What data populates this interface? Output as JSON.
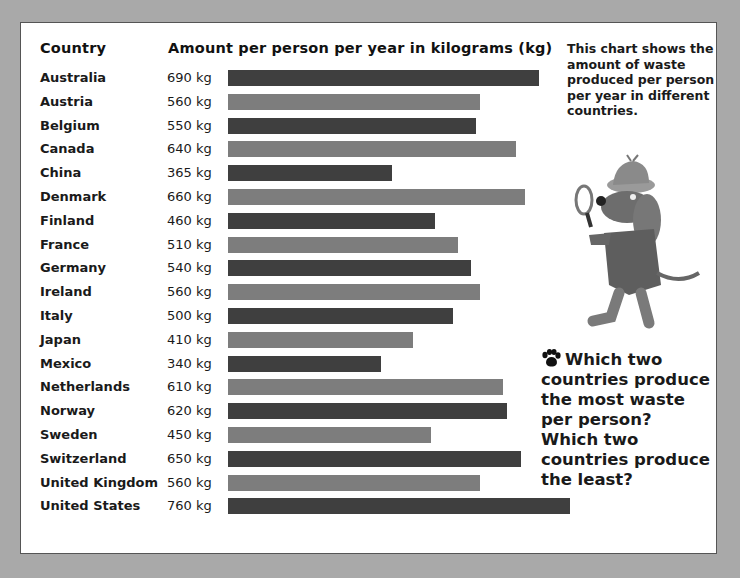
{
  "header": {
    "country_label": "Country",
    "amount_label": "Amount per person per year in kilograms (kg)"
  },
  "rows": [
    {
      "country": "Australia",
      "amount": "690 kg"
    },
    {
      "country": "Austria",
      "amount": "560 kg"
    },
    {
      "country": "Belgium",
      "amount": "550 kg"
    },
    {
      "country": "Canada",
      "amount": "640 kg"
    },
    {
      "country": "China",
      "amount": "365 kg"
    },
    {
      "country": "Denmark",
      "amount": "660 kg"
    },
    {
      "country": "Finland",
      "amount": "460 kg"
    },
    {
      "country": "France",
      "amount": "510 kg"
    },
    {
      "country": "Germany",
      "amount": "540 kg"
    },
    {
      "country": "Ireland",
      "amount": "560 kg"
    },
    {
      "country": "Italy",
      "amount": "500 kg"
    },
    {
      "country": "Japan",
      "amount": "410 kg"
    },
    {
      "country": "Mexico",
      "amount": "340 kg"
    },
    {
      "country": "Netherlands",
      "amount": "610 kg"
    },
    {
      "country": "Norway",
      "amount": "620 kg"
    },
    {
      "country": "Sweden",
      "amount": "450 kg"
    },
    {
      "country": "Switzerland",
      "amount": "650 kg"
    },
    {
      "country": "United Kingdom",
      "amount": "560 kg"
    },
    {
      "country": "United States",
      "amount": "760 kg"
    }
  ],
  "note": "This chart shows the amount of waste produced per person per year in different countries.",
  "question": {
    "icon": "paw-icon",
    "text": "Which two countries produce the most waste per person? Which two countries produce the least?"
  },
  "colors": {
    "bar_dark": "#3f3f3f",
    "bar_light": "#7d7d7d",
    "background": "#a9a9a9",
    "panel": "#ffffff"
  },
  "chart_data": {
    "type": "bar",
    "orientation": "horizontal",
    "title": "Amount per person per year in kilograms (kg)",
    "xlabel": "Amount per person per year in kilograms (kg)",
    "ylabel": "Country",
    "categories": [
      "Australia",
      "Austria",
      "Belgium",
      "Canada",
      "China",
      "Denmark",
      "Finland",
      "France",
      "Germany",
      "Ireland",
      "Italy",
      "Japan",
      "Mexico",
      "Netherlands",
      "Norway",
      "Sweden",
      "Switzerland",
      "United Kingdom",
      "United States"
    ],
    "values": [
      690,
      560,
      550,
      640,
      365,
      660,
      460,
      510,
      540,
      560,
      500,
      410,
      340,
      610,
      620,
      450,
      650,
      560,
      760
    ],
    "units": "kg",
    "grid": false,
    "legend": "none",
    "bar_colors_alternating": [
      "#3f3f3f",
      "#7d7d7d"
    ],
    "xlim": [
      0,
      760
    ]
  }
}
